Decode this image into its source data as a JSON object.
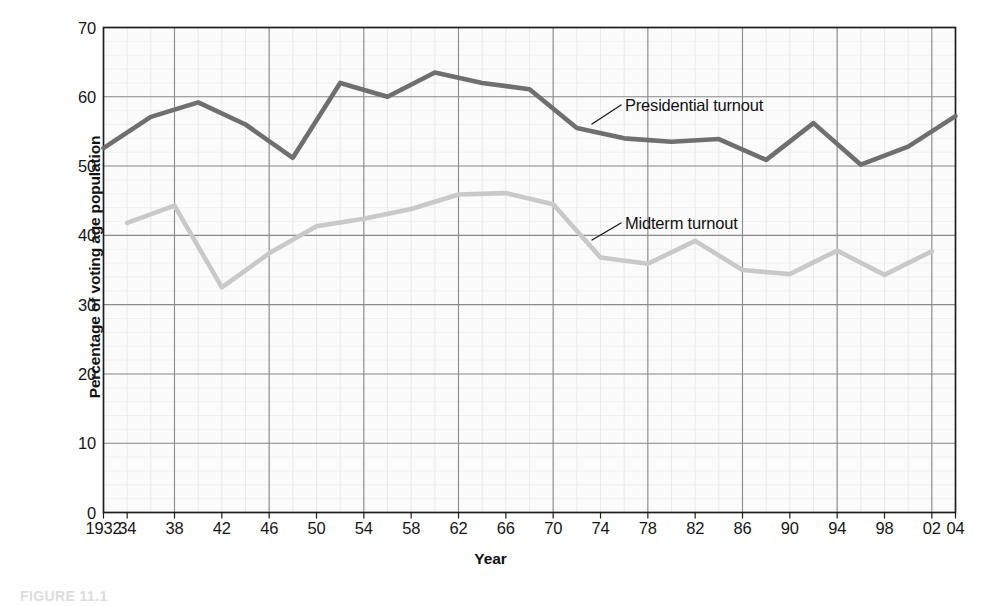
{
  "figure": {
    "caption": "FIGURE 11.1"
  },
  "chart_data": {
    "type": "line",
    "title": "",
    "xlabel": "Year",
    "ylabel": "Percentage of voting age population",
    "xlim": [
      1932,
      2004
    ],
    "ylim": [
      0,
      70
    ],
    "yticks": [
      0,
      10,
      20,
      30,
      40,
      50,
      60,
      70
    ],
    "ytick_labels": [
      "0",
      "10",
      "20",
      "30",
      "40",
      "50",
      "60",
      "70"
    ],
    "xticks": [
      1932,
      1934,
      1938,
      1942,
      1946,
      1950,
      1954,
      1958,
      1962,
      1966,
      1970,
      1974,
      1978,
      1982,
      1986,
      1990,
      1994,
      1998,
      2002,
      2004
    ],
    "xtick_labels": [
      "1932",
      "34",
      "38",
      "42",
      "46",
      "50",
      "54",
      "58",
      "62",
      "66",
      "70",
      "74",
      "78",
      "82",
      "86",
      "90",
      "94",
      "98",
      "02",
      "04"
    ],
    "grid": true,
    "grid_major_x_years": [
      1932,
      1938,
      1946,
      1954,
      1962,
      1970,
      1978,
      1986,
      1994,
      2002
    ],
    "grid_minor_spacing_years": 2,
    "legend_position": "inline-annotations",
    "series": [
      {
        "name": "Presidential turnout",
        "color": "#6f6f6f",
        "x": [
          1932,
          1936,
          1940,
          1944,
          1948,
          1952,
          1956,
          1960,
          1964,
          1968,
          1972,
          1976,
          1980,
          1984,
          1988,
          1992,
          1996,
          2000,
          2004
        ],
        "values": [
          52.6,
          57.1,
          59.2,
          56.0,
          51.2,
          62.0,
          60.0,
          63.5,
          62.0,
          61.1,
          55.5,
          54.0,
          53.5,
          53.9,
          50.9,
          56.2,
          50.2,
          52.8,
          57.2
        ]
      },
      {
        "name": "Midterm turnout",
        "color": "#c9c9c9",
        "x": [
          1934,
          1938,
          1942,
          1946,
          1950,
          1954,
          1958,
          1962,
          1966,
          1970,
          1974,
          1978,
          1982,
          1986,
          1990,
          1994,
          1998,
          2002
        ],
        "values": [
          41.8,
          44.3,
          32.5,
          37.4,
          41.3,
          42.4,
          43.8,
          45.9,
          46.1,
          44.5,
          36.8,
          35.9,
          39.2,
          35.0,
          34.4,
          37.8,
          34.3,
          37.7
        ]
      }
    ],
    "annotations": [
      {
        "text": "Presidential turnout",
        "target_series": "Presidential turnout",
        "target_year": 1972
      },
      {
        "text": "Midterm turnout",
        "target_series": "Midterm turnout",
        "target_year": 1970
      }
    ]
  }
}
